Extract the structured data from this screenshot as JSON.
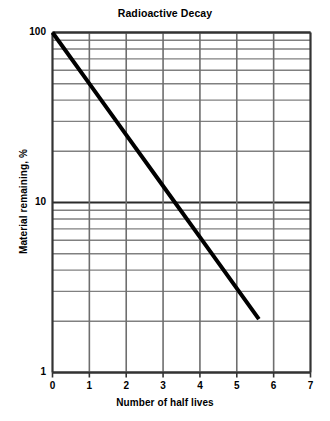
{
  "chart_data": {
    "type": "line",
    "title": "Radioactive Decay",
    "xlabel": "Number of half lives",
    "ylabel": "Material remaining, %",
    "xscale": "linear",
    "yscale": "log",
    "xlim": [
      0,
      7
    ],
    "ylim": [
      1,
      100
    ],
    "grid": true,
    "legend": null,
    "x_ticks": [
      "0",
      "1",
      "2",
      "3",
      "4",
      "5",
      "6",
      "7"
    ],
    "x_tick_values": [
      0,
      1,
      2,
      3,
      4,
      5,
      6,
      7
    ],
    "y_ticks": [
      "1",
      "10",
      "100"
    ],
    "y_tick_values": [
      1,
      10,
      100
    ],
    "y_minor_gridlines": [
      2,
      3,
      4,
      5,
      6,
      7,
      8,
      9,
      20,
      30,
      40,
      50,
      60,
      70,
      80,
      90
    ],
    "line_color": "#000000",
    "line_width": 4,
    "grid_color": "#808080",
    "axis_color": "#333333",
    "series": [
      {
        "name": "Material remaining",
        "x": [
          0,
          1,
          2,
          3,
          4,
          5,
          5.6
        ],
        "values": [
          100,
          50,
          25,
          12.5,
          6.25,
          3.125,
          2.06
        ]
      }
    ],
    "annotations": []
  }
}
